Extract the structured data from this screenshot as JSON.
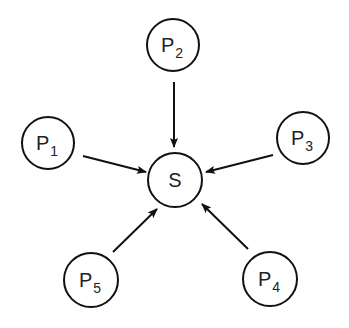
{
  "diagram": {
    "type": "star-graph",
    "center": {
      "id": "S",
      "label": "S",
      "cx": 175,
      "cy": 180,
      "r": 27
    },
    "nodes": [
      {
        "id": "P1",
        "label": "P",
        "sub": "1",
        "cx": 48,
        "cy": 143,
        "r": 26
      },
      {
        "id": "P2",
        "label": "P",
        "sub": "2",
        "cx": 173,
        "cy": 45,
        "r": 26
      },
      {
        "id": "P3",
        "label": "P",
        "sub": "3",
        "cx": 303,
        "cy": 138,
        "r": 26
      },
      {
        "id": "P4",
        "label": "P",
        "sub": "4",
        "cx": 270,
        "cy": 279,
        "r": 27
      },
      {
        "id": "P5",
        "label": "P",
        "sub": "5",
        "cx": 91,
        "cy": 280,
        "r": 27
      }
    ],
    "edges": [
      {
        "from": "P1",
        "to": "S",
        "x1": 83,
        "y1": 156,
        "x2": 146,
        "y2": 172
      },
      {
        "from": "P2",
        "to": "S",
        "x1": 174,
        "y1": 82,
        "x2": 174,
        "y2": 147
      },
      {
        "from": "P3",
        "to": "S",
        "x1": 273,
        "y1": 155,
        "x2": 206,
        "y2": 172
      },
      {
        "from": "P4",
        "to": "S",
        "x1": 248,
        "y1": 249,
        "x2": 202,
        "y2": 204
      },
      {
        "from": "P5",
        "to": "S",
        "x1": 113,
        "y1": 252,
        "x2": 157,
        "y2": 209
      }
    ],
    "colors": {
      "stroke": "#111111",
      "background": "#ffffff",
      "text": "#222222"
    }
  }
}
